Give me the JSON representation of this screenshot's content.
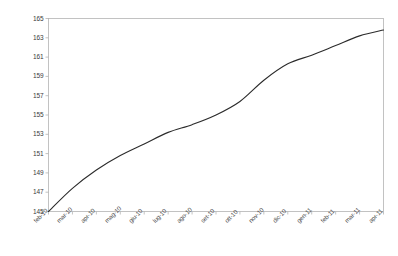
{
  "chart_data": {
    "type": "line",
    "title": "",
    "subtitle": "",
    "xlabel": "",
    "ylabel": "",
    "grid": false,
    "legend": null,
    "legend_position": "none",
    "line_color": "#2b2b2b",
    "axis_color": "#b4b4b4",
    "categories": [
      "feb-10",
      "mar-10",
      "apr-10",
      "mag-10",
      "giu-10",
      "lug-10",
      "ago-10",
      "set-10",
      "ott-10",
      "nov-10",
      "dic-10",
      "gen-11",
      "feb-11",
      "mar-11",
      "apr-11"
    ],
    "values": [
      145.0,
      147.4,
      149.3,
      150.8,
      152.0,
      153.2,
      154.0,
      155.0,
      156.4,
      158.6,
      160.3,
      161.2,
      162.2,
      163.2,
      163.8
    ],
    "x": [
      0,
      1,
      2,
      3,
      4,
      5,
      6,
      7,
      8,
      9,
      10,
      11,
      12,
      13,
      14
    ],
    "ylim": [
      145,
      165
    ],
    "ytick_values": [
      145,
      147,
      149,
      151,
      153,
      155,
      157,
      159,
      161,
      163,
      165
    ],
    "ytick_labels": [
      "145",
      "147",
      "149",
      "151",
      "153",
      "155",
      "157",
      "159",
      "161",
      "163",
      "165"
    ],
    "xlim": [
      0,
      14
    ],
    "annotations": []
  }
}
